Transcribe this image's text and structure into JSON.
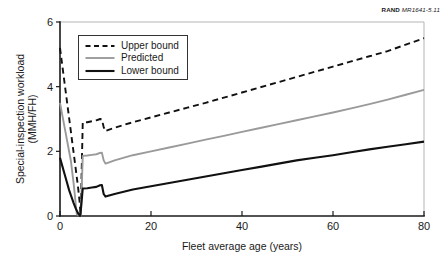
{
  "credit": {
    "brand": "RAND",
    "document_id": "MR1641-5.11"
  },
  "chart_data": {
    "type": "line",
    "title": "",
    "xlabel": "Fleet average age (years)",
    "ylabel": "Special-inspection workload (MMH/FH)",
    "ylabel_line1": "Special-inspection workload",
    "ylabel_line2": "(MMH/FH)",
    "xlim": [
      0,
      80
    ],
    "ylim": [
      0,
      6
    ],
    "xticks": [
      0,
      20,
      40,
      60,
      80
    ],
    "yticks": [
      0,
      2,
      4,
      6
    ],
    "xtick_labels": [
      "0",
      "20",
      "40",
      "60",
      "80"
    ],
    "ytick_labels": [
      "0",
      "2",
      "4",
      "6"
    ],
    "grid": false,
    "legend_position": "upper-left-inside",
    "series": [
      {
        "name": "Upper bound",
        "style": "dashed",
        "color": "#111111",
        "x": [
          0,
          0.6,
          1.2,
          1.8,
          2.4,
          3.0,
          3.6,
          4.0,
          4.3,
          4.5,
          4.6,
          5.0,
          6.0,
          7.0,
          8.0,
          8.8,
          9.2,
          9.6,
          10.0,
          10.2,
          12,
          16,
          20,
          24,
          28,
          32,
          36,
          40,
          44,
          48,
          52,
          56,
          60,
          64,
          68,
          72,
          76,
          80
        ],
        "y": [
          5.2,
          4.55,
          3.9,
          3.25,
          2.6,
          1.95,
          1.3,
          0.85,
          0.45,
          0.1,
          0.35,
          2.9,
          2.9,
          2.93,
          2.96,
          3.0,
          2.99,
          2.75,
          2.62,
          2.64,
          2.73,
          2.9,
          3.05,
          3.2,
          3.35,
          3.5,
          3.66,
          3.82,
          3.98,
          4.14,
          4.3,
          4.46,
          4.62,
          4.78,
          4.94,
          5.1,
          5.3,
          5.5
        ]
      },
      {
        "name": "Predicted",
        "style": "solid",
        "color": "#9a9a9a",
        "x": [
          0,
          0.6,
          1.2,
          1.8,
          2.4,
          3.0,
          3.3,
          3.5,
          3.7,
          4.5,
          4.6,
          5.0,
          6.0,
          7.0,
          8.0,
          8.8,
          9.2,
          9.6,
          10.0,
          10.2,
          12,
          16,
          20,
          24,
          28,
          32,
          36,
          40,
          44,
          48,
          52,
          56,
          60,
          64,
          68,
          72,
          76,
          80
        ],
        "y": [
          3.5,
          3.05,
          2.6,
          2.15,
          1.7,
          1.0,
          0.6,
          0.3,
          0.05,
          0.0,
          0.1,
          1.86,
          1.87,
          1.89,
          1.91,
          1.95,
          1.96,
          1.72,
          1.62,
          1.63,
          1.72,
          1.88,
          2.0,
          2.12,
          2.24,
          2.36,
          2.48,
          2.6,
          2.72,
          2.84,
          2.96,
          3.08,
          3.2,
          3.33,
          3.46,
          3.6,
          3.75,
          3.9
        ]
      },
      {
        "name": "Lower bound",
        "style": "solid",
        "color": "#111111",
        "x": [
          0,
          0.5,
          1.0,
          1.5,
          2.0,
          2.5,
          3.0,
          3.5,
          4.0,
          4.4,
          4.5,
          5.0,
          6.0,
          7.0,
          8.0,
          8.8,
          9.2,
          9.6,
          10.0,
          10.2,
          12,
          16,
          20,
          24,
          28,
          32,
          36,
          40,
          44,
          48,
          52,
          56,
          60,
          64,
          68,
          72,
          76,
          80
        ],
        "y": [
          1.8,
          1.55,
          1.3,
          1.05,
          0.8,
          0.6,
          0.4,
          0.22,
          0.08,
          0.0,
          0.06,
          0.85,
          0.86,
          0.88,
          0.9,
          0.95,
          0.96,
          0.68,
          0.6,
          0.61,
          0.68,
          0.82,
          0.92,
          1.02,
          1.12,
          1.22,
          1.32,
          1.42,
          1.52,
          1.62,
          1.72,
          1.8,
          1.88,
          1.97,
          2.06,
          2.14,
          2.22,
          2.3
        ]
      }
    ]
  },
  "legend": {
    "items": [
      {
        "label": "Upper bound",
        "style": "dashed",
        "color": "#111111"
      },
      {
        "label": "Predicted",
        "style": "solid",
        "color": "#9a9a9a"
      },
      {
        "label": "Lower bound",
        "style": "solid",
        "color": "#111111"
      }
    ]
  }
}
